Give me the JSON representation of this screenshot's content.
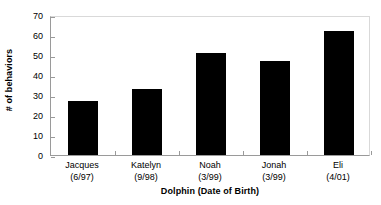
{
  "chart_data": {
    "type": "bar",
    "title": "",
    "xlabel": "Dolphin (Date of Birth)",
    "ylabel": "# of behaviors",
    "categories": [
      "Jacques\n(6/97)",
      "Katelyn\n(9/98)",
      "Noah\n(3/99)",
      "Jonah\n(3/99)",
      "Eli\n(4/01)"
    ],
    "category_names": [
      "Jacques",
      "Katelyn",
      "Noah",
      "Jonah",
      "Eli"
    ],
    "category_dobs": [
      "(6/97)",
      "(9/98)",
      "(3/99)",
      "(3/99)",
      "(4/01)"
    ],
    "values": [
      27,
      33,
      51,
      47,
      62
    ],
    "ylim": [
      0,
      70
    ],
    "ytick_labels": [
      "70",
      "60",
      "50",
      "40",
      "30",
      "20",
      "10",
      "0"
    ],
    "ytick_values": [
      70,
      60,
      50,
      40,
      30,
      20,
      10,
      0
    ],
    "grid": false,
    "legend": "none",
    "bar_color": "#000000",
    "axis_color": "#9a9a9a"
  }
}
